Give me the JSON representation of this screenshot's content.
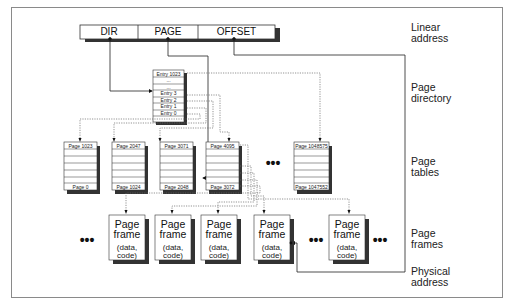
{
  "diagram": {
    "linear_address": {
      "fields": [
        "DIR",
        "PAGE",
        "OFFSET"
      ]
    },
    "page_directory": {
      "entries": [
        "Entry 1023",
        "...",
        "...",
        "Entry 3",
        "Entry 2",
        "Entry 1",
        "Entry 0"
      ]
    },
    "page_tables": [
      {
        "top": "Page 1023",
        "bottom": "Page 0"
      },
      {
        "top": "Page 2047",
        "bottom": "Page 1024"
      },
      {
        "top": "Page 3071",
        "bottom": "Page 2048"
      },
      {
        "top": "Page 4095",
        "bottom": "Page 3072"
      },
      {
        "top": "Page 1048575",
        "bottom": "Page 1047552"
      }
    ],
    "page_frames": [
      {
        "title_line1": "Page",
        "title_line2": "frame",
        "sub_line1": "(data,",
        "sub_line2": "code)"
      },
      {
        "title_line1": "Page",
        "title_line2": "frame",
        "sub_line1": "(data,",
        "sub_line2": "code)"
      },
      {
        "title_line1": "Page",
        "title_line2": "frame",
        "sub_line1": "(data,",
        "sub_line2": "code)"
      },
      {
        "title_line1": "Page",
        "title_line2": "frame",
        "sub_line1": "(data,",
        "sub_line2": "code)"
      },
      {
        "title_line1": "Page",
        "title_line2": "frame",
        "sub_line1": "(data,",
        "sub_line2": "code)"
      }
    ],
    "ellipsis": "•••",
    "side_labels": {
      "linear_address": [
        "Linear",
        "address"
      ],
      "page_directory": [
        "Page",
        "directory"
      ],
      "page_tables": [
        "Page",
        "tables"
      ],
      "page_frames": [
        "Page",
        "frames"
      ],
      "physical_address": [
        "Physical",
        "address"
      ]
    },
    "colors": {
      "line": "#222222",
      "shadow": "#3a3a3a",
      "dotted": "#666666",
      "border": "#8a8a8a"
    }
  }
}
